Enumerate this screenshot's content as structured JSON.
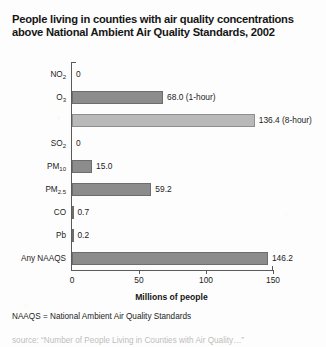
{
  "title": "People living in counties with air quality concentrations above National Ambient Air Quality Standards, 2002",
  "footnote": "NAAQS = National Ambient Air Quality Standards",
  "source_partial": "source: “Number of People Living in Counties with Air Quality…”",
  "colors": {
    "bar_dark": "#8c8c8c",
    "bar_light": "#b9b9b9",
    "axis": "#5a5a5a",
    "background": "#fdfdfd",
    "text": "#1c1c1c"
  },
  "chart_data": {
    "type": "bar",
    "orientation": "horizontal",
    "title": "People living in counties with air quality concentrations above National Ambient Air Quality Standards, 2002",
    "xlabel": "Millions of people",
    "ylabel": "",
    "xlim": [
      0,
      150
    ],
    "xticks": [
      0,
      50,
      100,
      150
    ],
    "xtick_labels": [
      "0",
      "50",
      "100",
      "150"
    ],
    "grid": false,
    "legend": false,
    "categories": [
      "NO2",
      "O3",
      "SO2",
      "PM10",
      "PM2.5",
      "CO",
      "Pb",
      "Any NAAQS"
    ],
    "bars": [
      {
        "category": "NO2",
        "label_html": "NO<sub>2</sub>",
        "value": 0,
        "data_label": "0",
        "shade": "dark"
      },
      {
        "category": "O3",
        "label_html": "O<sub>3</sub>",
        "value": 68.0,
        "data_label": "68.0 (1-hour)",
        "shade": "dark"
      },
      {
        "category": "O3",
        "label_html": "",
        "value": 136.4,
        "data_label": "136.4 (8-hour)",
        "shade": "light"
      },
      {
        "category": "SO2",
        "label_html": "SO<sub>2</sub>",
        "value": 0,
        "data_label": "0",
        "shade": "dark"
      },
      {
        "category": "PM10",
        "label_html": "PM<sub>10</sub>",
        "value": 15.0,
        "data_label": "15.0",
        "shade": "dark"
      },
      {
        "category": "PM2.5",
        "label_html": "PM<sub>2.5</sub>",
        "value": 59.2,
        "data_label": "59.2",
        "shade": "dark"
      },
      {
        "category": "CO",
        "label_html": "CO",
        "value": 0.7,
        "data_label": "0.7",
        "shade": "dark"
      },
      {
        "category": "Pb",
        "label_html": "Pb",
        "value": 0.2,
        "data_label": "0.2",
        "shade": "dark"
      },
      {
        "category": "Any NAAQS",
        "label_html": "Any NAAQS",
        "value": 146.2,
        "data_label": "146.2",
        "shade": "dark"
      }
    ]
  }
}
